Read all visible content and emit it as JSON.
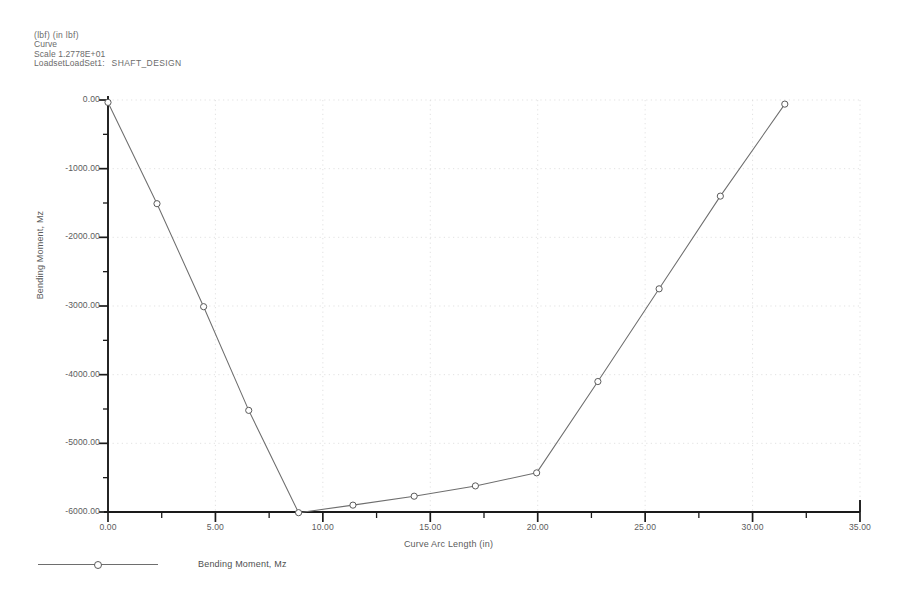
{
  "header": {
    "units": "(lbf)  (in lbf)",
    "curve": "Curve",
    "scale": "Scale  1.2778E+01",
    "loadset_prefix": "LoadsetLoadSet1:",
    "loadset_name": "SHAFT_DESIGN"
  },
  "legend": {
    "label": "Bending Moment, Mz",
    "marker": "circle-marker",
    "position": "bottom-left"
  },
  "chart_data": {
    "type": "line",
    "title": "",
    "subtitle": "",
    "xlabel": "Curve Arc Length (in)",
    "ylabel": "Bending Moment, Mz",
    "xlim": [
      0,
      35
    ],
    "ylim": [
      -6000,
      0
    ],
    "xticks": [
      "0.00",
      "5.00",
      "10.00",
      "15.00",
      "20.00",
      "25.00",
      "30.00",
      "35.00"
    ],
    "xtick_values": [
      0,
      5,
      10,
      15,
      20,
      25,
      30,
      35
    ],
    "yticks": [
      "0.00",
      "-1000.00",
      "-2000.00",
      "-3000.00",
      "-4000.00",
      "-5000.00",
      "-6000.00"
    ],
    "ytick_values": [
      0,
      -1000,
      -2000,
      -3000,
      -4000,
      -5000,
      -6000
    ],
    "grid": true,
    "grid_style": "dotted",
    "legend_position": "below-axes-left",
    "series": [
      {
        "name": "Bending Moment, Mz",
        "color": "#6e6e6e",
        "marker": "open-circle",
        "x": [
          0.0,
          2.28,
          4.45,
          6.55,
          8.87,
          11.4,
          14.25,
          17.1,
          19.95,
          22.8,
          25.65,
          28.5,
          31.5
        ],
        "y": [
          -35,
          -1510,
          -3010,
          -4520,
          -6010,
          -5900,
          -5770,
          -5620,
          -5430,
          -4100,
          -2750,
          -1400,
          -60
        ]
      }
    ]
  },
  "colors": {
    "line": "#6e6e6e",
    "axis": "#1a1a1a",
    "grid": "#d8d8d8",
    "text": "#5c5c5c",
    "background": "#ffffff"
  }
}
